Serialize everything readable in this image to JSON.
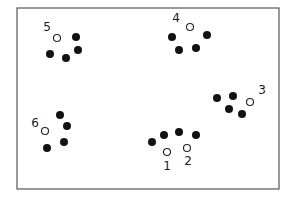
{
  "frame": {
    "x": 17,
    "y": 8,
    "width": 262,
    "height": 181,
    "stroke": "#555555"
  },
  "colors": {
    "filled": "#111111",
    "open_stroke": "#222222",
    "open_fill": "#ffffff"
  },
  "clusters": [
    {
      "id": 1,
      "label": "1",
      "label_pos": [
        167,
        170
      ],
      "open": [
        [
          167,
          152
        ]
      ],
      "filled": [
        [
          152,
          142
        ],
        [
          164,
          135
        ],
        [
          179,
          132
        ],
        [
          196,
          135
        ]
      ]
    },
    {
      "id": 2,
      "label": "2",
      "label_pos": [
        188,
        165
      ],
      "open": [
        [
          187,
          148
        ]
      ],
      "filled": []
    },
    {
      "id": 3,
      "label": "3",
      "label_pos": [
        262,
        94
      ],
      "open": [
        [
          250,
          102
        ]
      ],
      "filled": [
        [
          217,
          98
        ],
        [
          233,
          96
        ],
        [
          229,
          109
        ],
        [
          242,
          114
        ]
      ]
    },
    {
      "id": 4,
      "label": "4",
      "label_pos": [
        176,
        22
      ],
      "open": [
        [
          190,
          27
        ]
      ],
      "filled": [
        [
          172,
          37
        ],
        [
          207,
          35
        ],
        [
          179,
          50
        ],
        [
          196,
          48
        ]
      ]
    },
    {
      "id": 5,
      "label": "5",
      "label_pos": [
        47,
        31
      ],
      "open": [
        [
          57,
          38
        ]
      ],
      "filled": [
        [
          76,
          37
        ],
        [
          78,
          50
        ],
        [
          50,
          54
        ],
        [
          66,
          58
        ]
      ]
    },
    {
      "id": 6,
      "label": "6",
      "label_pos": [
        35,
        127
      ],
      "open": [
        [
          45,
          131
        ]
      ],
      "filled": [
        [
          60,
          115
        ],
        [
          67,
          126
        ],
        [
          64,
          142
        ],
        [
          47,
          148
        ]
      ]
    }
  ],
  "radius": {
    "filled": 4,
    "open": 3.5
  }
}
